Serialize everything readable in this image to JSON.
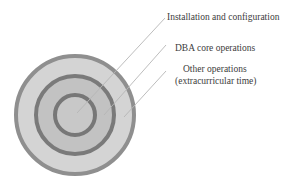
{
  "diagram": {
    "type": "concentric-circles",
    "colors": {
      "outer_fill": "#d4d4d4",
      "outer_border": "#8f8f8f",
      "middle_fill": "#c2c2c2",
      "middle_border": "#7a7a7a",
      "inner_fill": "#c8c8c8",
      "inner_border": "#777777",
      "leader_line": "#b5b5b5"
    },
    "labels": [
      {
        "id": "installation",
        "text": "Installation and configuration"
      },
      {
        "id": "dba-core",
        "text": "DBA core operations"
      },
      {
        "id": "other-1",
        "text": "Other  operations"
      },
      {
        "id": "other-2",
        "text": "(extracurricular time)"
      }
    ]
  }
}
